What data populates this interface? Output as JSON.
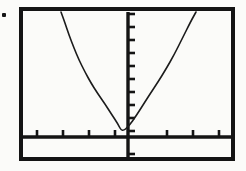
{
  "figure": {
    "kind": "graphing-calculator-screen",
    "background_color": "#fbfbf9",
    "ink_color": "#141414",
    "frame": {
      "border_width_px": 4,
      "left": 19,
      "top": 7,
      "width": 216,
      "height": 154
    },
    "margin_mark": {
      "name": "stray-ink-dot",
      "x": 2,
      "y": 13,
      "size": 4
    }
  },
  "chart_data": {
    "type": "line",
    "title": "",
    "subtitle": "",
    "xlabel": "",
    "ylabel": "",
    "grid": false,
    "legend": "none",
    "axes": {
      "x_axis": {
        "orientation": "horizontal",
        "y_position_px": 130,
        "x_start_px": 4,
        "x_end_px": 212,
        "tick_direction": "up",
        "tick_length_px": 7,
        "tick_positions_px": [
          18,
          44,
          70,
          96,
          148,
          174,
          200,
          209
        ],
        "tick_count": 8,
        "xlim": [
          -4.7,
          4.0
        ],
        "tick_values": [
          -4,
          -3,
          -2,
          -1,
          1,
          2,
          3,
          4
        ]
      },
      "y_axis": {
        "orientation": "vertical",
        "x_position_px": 109,
        "y_start_px": 5,
        "y_end_px": 150,
        "tick_direction": "right",
        "tick_length_px": 7,
        "tick_positions_px": [
          7,
          20,
          33,
          46,
          59,
          72,
          85,
          98,
          111,
          124,
          147
        ],
        "tick_count": 11,
        "ylim": [
          -1.0,
          11.0
        ],
        "tick_values": [
          10,
          9,
          8,
          7,
          6,
          5,
          4,
          3,
          2,
          1,
          -1
        ]
      }
    },
    "series": [
      {
        "name": "parabola",
        "shape": "upward-opening parabola",
        "vertex_px": [
          103,
          125
        ],
        "vertex_value": [
          -0.25,
          0.3
        ],
        "equation": "y = a(x + 0.25)^2 + 0.3",
        "points_px": [
          [
            42,
            5
          ],
          [
            46,
            16
          ],
          [
            50,
            28
          ],
          [
            55,
            41
          ],
          [
            60,
            53
          ],
          [
            66,
            65
          ],
          [
            72,
            76
          ],
          [
            79,
            87
          ],
          [
            86,
            97
          ],
          [
            93,
            108
          ],
          [
            99,
            117
          ],
          [
            103,
            125
          ],
          [
            110,
            119
          ],
          [
            117,
            109
          ],
          [
            124,
            98
          ],
          [
            131,
            87
          ],
          [
            139,
            75
          ],
          [
            147,
            62
          ],
          [
            155,
            48
          ],
          [
            163,
            32
          ],
          [
            172,
            14
          ],
          [
            177,
            5
          ]
        ]
      }
    ]
  }
}
